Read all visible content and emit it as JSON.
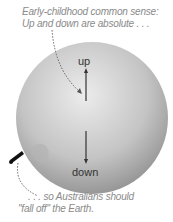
{
  "captions": {
    "top_line1": "Early-childhood common sense:",
    "top_line2": "Up and down are absolute . . .",
    "bottom_line1": ". . . so Australians should",
    "bottom_line2": "\"fall off\" the Earth."
  },
  "labels": {
    "up": "up",
    "down": "down"
  },
  "colors": {
    "globe_light": "#e8e8e8",
    "globe_dark": "#8c8c8c",
    "text": "#8a8a8a"
  }
}
